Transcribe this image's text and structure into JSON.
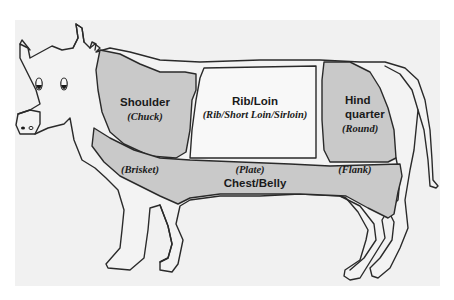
{
  "diagram": {
    "colors": {
      "background": "#f1f1f1",
      "cut_highlight": "#c9c9c9",
      "cut_plain": "#f8f8f8",
      "outline": "#2a2a2a"
    },
    "cuts": [
      {
        "id": "shoulder",
        "name": "Shoulder",
        "subname": "(Chuck)",
        "shaded": true
      },
      {
        "id": "rib-loin",
        "name": "Rib/Loin",
        "subname": "(Rib/Short Loin/Sirloin)",
        "shaded": false
      },
      {
        "id": "hindquarter",
        "name_lines": [
          "Hind",
          "quarter"
        ],
        "subname": "(Round)",
        "shaded": true
      },
      {
        "id": "chest-belly",
        "name": "Chest/Belly",
        "subnames": [
          "(Brisket)",
          "(Plate)",
          "(Flank)"
        ],
        "shaded": true
      }
    ]
  }
}
